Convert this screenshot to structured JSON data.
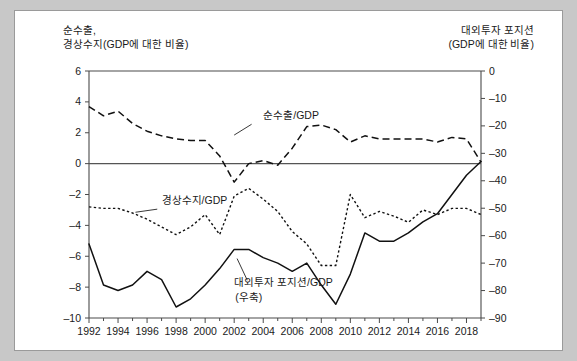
{
  "headers": {
    "left_line1": "순수출,",
    "left_line2": "경상수지(GDP에 대한 비율)",
    "right_line1": "대외투자 포지션",
    "right_line2": "(GDP에 대한 비율)"
  },
  "chart_data": {
    "type": "line",
    "title": "",
    "xlabel": "",
    "ylabel": "순수출, 경상수지(GDP에 대한 비율)",
    "y2label": "대외투자 포지션(GDP에 대한 비율)",
    "grid": false,
    "legend": "inline-annotations",
    "xlim": [
      1992,
      2019
    ],
    "ylim": [
      -10,
      6
    ],
    "y2lim": [
      -90,
      0
    ],
    "xticks": [
      1992,
      1994,
      1996,
      1998,
      2000,
      2002,
      2004,
      2006,
      2008,
      2010,
      2012,
      2014,
      2016,
      2018
    ],
    "xminorticks": [
      1993,
      1995,
      1997,
      1999,
      2001,
      2003,
      2005,
      2007,
      2009,
      2011,
      2013,
      2015,
      2017,
      2019
    ],
    "yticks": [
      6,
      4,
      2,
      0,
      -2,
      -4,
      -6,
      -8,
      -10
    ],
    "y2ticks": [
      0,
      -10,
      -20,
      -30,
      -40,
      -50,
      -60,
      -70,
      -80,
      -90
    ],
    "x": [
      1992,
      1993,
      1994,
      1995,
      1996,
      1997,
      1998,
      1999,
      2000,
      2001,
      2002,
      2003,
      2004,
      2005,
      2006,
      2007,
      2008,
      2009,
      2010,
      2011,
      2012,
      2013,
      2014,
      2015,
      2016,
      2017,
      2018,
      2019
    ],
    "series": [
      {
        "name": "순수출/GDP",
        "axis": "left",
        "style": "dashed",
        "values": [
          3.7,
          3.1,
          3.4,
          2.6,
          2.1,
          1.8,
          1.6,
          1.5,
          1.5,
          0.5,
          -1.2,
          0.0,
          0.2,
          -0.1,
          1.0,
          2.4,
          2.5,
          2.2,
          1.4,
          1.8,
          1.6,
          1.6,
          1.6,
          1.6,
          1.4,
          1.7,
          1.6,
          0.1
        ]
      },
      {
        "name": "경상수지/GDP",
        "axis": "left",
        "style": "dotted",
        "values": [
          -2.8,
          -2.9,
          -2.9,
          -3.2,
          -3.6,
          -4.1,
          -4.6,
          -4.1,
          -3.3,
          -4.6,
          -2.1,
          -1.6,
          -2.3,
          -3.1,
          -4.4,
          -5.2,
          -6.6,
          -6.6,
          -2.0,
          -3.5,
          -3.1,
          -3.4,
          -3.8,
          -3.0,
          -3.3,
          -2.9,
          -2.9,
          -3.3
        ]
      },
      {
        "name": "대외투자 포지션/GDP (우축)",
        "axis": "right",
        "style": "solid",
        "values": [
          -63.0,
          -78.0,
          -80.0,
          -78.0,
          -73.0,
          -76.0,
          -86.0,
          -83.0,
          -78.0,
          -72.0,
          -65.0,
          -65.0,
          -68.0,
          -70.0,
          -73.0,
          -70.0,
          -78.0,
          -85.0,
          -74.0,
          -59.0,
          -62.0,
          -62.0,
          -59.0,
          -55.0,
          -52.0,
          -45.0,
          -38.0,
          -33.0
        ]
      }
    ],
    "annotations": [
      {
        "text": "순수출/GDP",
        "x": 2004,
        "y": 2.9
      },
      {
        "text": "경상수지/GDP",
        "x": 1997,
        "y": -2.6
      },
      {
        "text": "대외투자 포지션/GDP",
        "x": 2002,
        "y": -7.9
      },
      {
        "text": "(우축)",
        "x": 2003,
        "y": -8.9
      }
    ]
  }
}
